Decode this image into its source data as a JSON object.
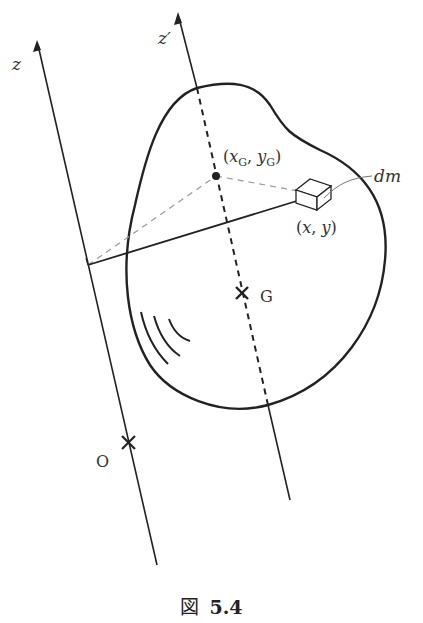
{
  "figure": {
    "caption_prefix": "図",
    "caption_number": "5.4",
    "colors": {
      "stroke": "#222222",
      "guide_dashed": "#999999",
      "text": "#333333",
      "background": "#ffffff"
    },
    "labels": {
      "axis_z": "z",
      "axis_z_prime": "z′",
      "centroid_coords": "(xG, yG)",
      "centroid_x": "x",
      "centroid_x_sub": "G",
      "centroid_y": "y",
      "centroid_y_sub": "G",
      "element_coords_open": "(",
      "element_x": "x",
      "element_sep": ", ",
      "element_y": "y",
      "element_coords_close": ")",
      "mass_element": "dm",
      "center_of_mass": "G",
      "origin": "O"
    }
  }
}
